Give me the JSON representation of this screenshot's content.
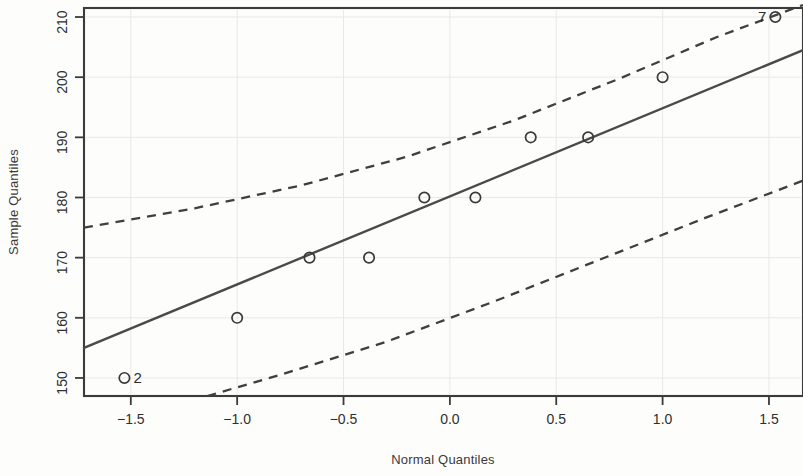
{
  "chart_data": {
    "type": "scatter",
    "title": "",
    "xlabel": "Normal Quantiles",
    "ylabel": "Sample Quantiles",
    "xlim": [
      -1.72,
      1.66
    ],
    "ylim": [
      147.0,
      211.5
    ],
    "xticks": [
      -1.5,
      -1.0,
      -0.5,
      0.0,
      0.5,
      1.0,
      1.5
    ],
    "xticklabels": [
      "-1.5",
      "-1.0",
      "-0.5",
      "0.0",
      "0.5",
      "1.0",
      "1.5"
    ],
    "yticks": [
      150,
      160,
      170,
      180,
      190,
      200,
      210
    ],
    "yticklabels": [
      "150",
      "160",
      "170",
      "180",
      "190",
      "200",
      "210"
    ],
    "grid": false,
    "legend": "none",
    "x": [
      -1.53,
      -1.0,
      -0.66,
      -0.38,
      -0.12,
      0.12,
      0.38,
      0.65,
      1.0,
      1.53
    ],
    "y": [
      150,
      160,
      170,
      170,
      180,
      180,
      190,
      190,
      200,
      210
    ],
    "point_labels": [
      {
        "text": "2",
        "x": -1.53,
        "y": 150,
        "anchor": "right"
      },
      {
        "text": "7",
        "x": 1.53,
        "y": 210,
        "anchor": "left"
      }
    ],
    "series": [
      {
        "name": "Sample points",
        "marker": "open-circle",
        "x": [
          -1.53,
          -1.0,
          -0.66,
          -0.38,
          -0.12,
          0.12,
          0.38,
          0.65,
          1.0,
          1.53
        ],
        "values": [
          150,
          160,
          170,
          170,
          180,
          180,
          190,
          190,
          200,
          210
        ]
      },
      {
        "name": "Reference line",
        "style": "solid",
        "x": [
          -1.72,
          1.66
        ],
        "values": [
          155.0,
          204.5
        ]
      },
      {
        "name": "Upper confidence band",
        "style": "dashed",
        "x": [
          -1.72,
          -1.2,
          -0.7,
          -0.2,
          0.3,
          0.8,
          1.25,
          1.66
        ],
        "values": [
          175.0,
          178.2,
          182.0,
          186.8,
          192.8,
          199.8,
          206.6,
          212.0
        ]
      },
      {
        "name": "Lower confidence band",
        "style": "dashed",
        "x": [
          -1.14,
          -0.8,
          -0.3,
          0.2,
          0.7,
          1.2,
          1.66
        ],
        "values": [
          147.0,
          150.5,
          156.0,
          162.6,
          169.6,
          176.6,
          182.8
        ]
      }
    ],
    "colors": {
      "point": "#3a3a3a",
      "fit_line": "#4a4a4a",
      "band": "#3f3f3f",
      "frame": "#3b3b3b",
      "background": "#fdfdfc"
    }
  }
}
